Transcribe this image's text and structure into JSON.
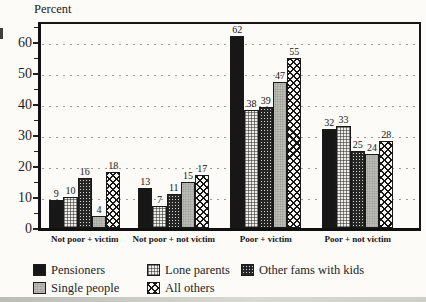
{
  "figure": {
    "axis_title": "Percent"
  },
  "chart_data": {
    "type": "bar",
    "title": "",
    "ylabel": "Percent",
    "xlabel": "",
    "categories": [
      "Not poor + victim",
      "Not poor + not victim",
      "Poor + victim",
      "Poor + not victim"
    ],
    "series": [
      {
        "name": "Pensioners",
        "pattern": "solid-black",
        "values": [
          9,
          13,
          62,
          32
        ]
      },
      {
        "name": "Lone parents",
        "pattern": "light-checker",
        "values": [
          10,
          7,
          38,
          33
        ]
      },
      {
        "name": "Other fams with kids",
        "pattern": "dark-checker",
        "values": [
          16,
          11,
          39,
          25
        ]
      },
      {
        "name": "Single people",
        "pattern": "gray-stipple",
        "values": [
          4,
          15,
          47,
          24
        ]
      },
      {
        "name": "All others",
        "pattern": "open-crosshatch",
        "values": [
          18,
          17,
          55,
          28
        ]
      }
    ],
    "y_ticks": [
      0,
      10,
      20,
      30,
      40,
      50,
      60
    ],
    "minor_y_ticks": [
      5,
      15,
      25,
      35,
      45,
      55,
      65
    ],
    "ylim": [
      0,
      67.5
    ],
    "grid": "dotted horizontal lines at major ticks",
    "bar_value_labels": true,
    "legend_position": "bottom",
    "legend_rows": [
      [
        "Pensioners",
        "Lone parents",
        "Other fams with kids"
      ],
      [
        "Single people",
        "All others"
      ]
    ],
    "colors": {
      "ink": "#161616",
      "background": "#fcfbf8",
      "gridline": "#9c9c96"
    }
  }
}
